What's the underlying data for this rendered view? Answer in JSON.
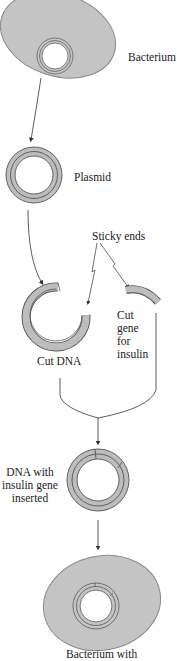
{
  "diagram": {
    "colors": {
      "cell_fill": "#c4c4c4",
      "cell_stroke": "#888888",
      "dna_fill": "#bdbdbd",
      "dna_stroke": "#555555",
      "line": "#333333",
      "text": "#222222"
    },
    "labels": {
      "bacterium": "Bacterium",
      "plasmid": "Plasmid",
      "sticky_ends": "Sticky ends",
      "cut_dna": "Cut DNA",
      "cut_gene": [
        "Cut",
        "gene",
        "for",
        "insulin"
      ],
      "dna_with_insulin": [
        "DNA with",
        "insulin gene",
        "inserted"
      ],
      "bacterium_with": "Bacterium with"
    },
    "steps": [
      "Bacterium",
      "Plasmid",
      "Cut DNA",
      "Cut gene for insulin",
      "DNA with insulin gene inserted",
      "Bacterium with"
    ]
  }
}
